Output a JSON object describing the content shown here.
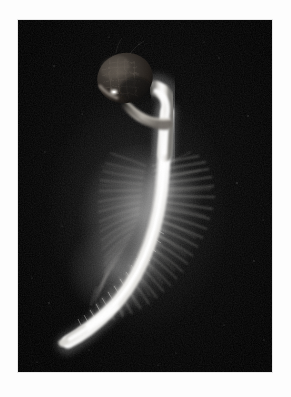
{
  "image": {
    "kind": "natural-image",
    "subject": "germinating seedling with root hairs",
    "title": "Germinating seedling on black background",
    "orientation": "portrait",
    "frame": {
      "canvas_width_px": 291,
      "canvas_height_px": 397,
      "border_color": "#fdfdfd",
      "plate_left_px": 18,
      "plate_top_px": 20,
      "plate_width_px": 254,
      "plate_height_px": 352
    },
    "palette": {
      "background_black": "#000000",
      "background_noise": "#111111",
      "seed_coat_dark": "#2a2724",
      "seed_coat_mid": "#4a4541",
      "seed_coat_highlight": "#7d746c",
      "seed_bright_speck": "#f2efe8",
      "hypocotyl_white": "#f4f3f0",
      "root_core_white": "#ffffff",
      "root_shadow": "#8d8b87",
      "root_hair_white": "#e9e8e5",
      "root_hair_faint": "#6a6966"
    },
    "parts": [
      {
        "name": "seed-coat",
        "label": "Seed coat / testa",
        "tone": "dark brown-grey",
        "cx_px": 125,
        "cy_px": 78,
        "rx_px": 27,
        "ry_px": 24
      },
      {
        "name": "coleoptile-collar",
        "label": "Sheath collar below seed",
        "tone": "pale grey",
        "cx_px": 132,
        "cy_px": 103
      },
      {
        "name": "hypocotyl",
        "label": "Hypocotyl / shoot axis",
        "tone": "bright white",
        "from_px": [
          148,
          96
        ],
        "to_px": [
          152,
          168
        ]
      },
      {
        "name": "root-hair-zone",
        "label": "Dense root hair zone",
        "tone": "white filaments",
        "x_range_px": [
          100,
          218
        ],
        "y_range_px": [
          162,
          320
        ]
      },
      {
        "name": "radicle",
        "label": "Radicle / primary root",
        "tone": "bright white",
        "from_px": [
          152,
          168
        ],
        "to_px": [
          52,
          330
        ]
      },
      {
        "name": "root-tip",
        "label": "Smooth root tip",
        "tone": "soft white",
        "cx_px": 55,
        "cy_px": 328
      }
    ],
    "notes": "Macro photograph: dark textured seed at top, glowing white axis curving down and to the left, dense halo of fine root hairs around the mid-root, smooth tapered tip at lower left; near-black field with faint dust specks."
  }
}
